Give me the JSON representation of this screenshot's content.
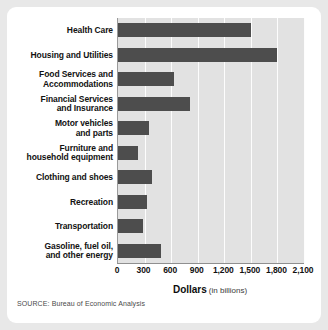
{
  "figure": {
    "source_note": "SOURCE: Bureau of Economic Analysis",
    "axis_title_main": "Dollars",
    "axis_title_sub": "(in billions)",
    "bar_color": "#4d4d4d",
    "plot_background": "#e2e2e2",
    "gridline_color": "#fdfdfd",
    "frame_color": "#ffffff",
    "page_background": "#e8e8e8"
  },
  "chart_data": {
    "type": "bar",
    "orientation": "horizontal",
    "title": "",
    "subtitle": "",
    "xlabel": "Dollars (in billions)",
    "ylabel": "",
    "xlim": [
      0,
      2100
    ],
    "grid": true,
    "legend": null,
    "categories": [
      "Health Care",
      "Housing and Utilities",
      "Food Services and Accommodations",
      "Financial Services and Insurance",
      "Motor vehicles and parts",
      "Furniture and household equipment",
      "Clothing and shoes",
      "Recreation",
      "Transportation",
      "Gasoline, fuel oil, and other energy"
    ],
    "category_label_lines": [
      [
        "Health Care"
      ],
      [
        "Housing and Utilities"
      ],
      [
        "Food Services and",
        "Accommodations"
      ],
      [
        "Financial Services",
        "and Insurance"
      ],
      [
        "Motor vehicles",
        "and parts"
      ],
      [
        "Furniture and",
        "household equipment"
      ],
      [
        "Clothing and shoes"
      ],
      [
        "Recreation"
      ],
      [
        "Transportation"
      ],
      [
        "Gasoline, fuel oil,",
        "and other energy"
      ]
    ],
    "values": [
      1500,
      1790,
      630,
      810,
      355,
      230,
      380,
      330,
      285,
      480
    ],
    "xticks": [
      0,
      300,
      600,
      900,
      1200,
      1500,
      1800,
      2100
    ],
    "xtick_labels": [
      "0",
      "300",
      "600",
      "900",
      "1,200",
      "1,500",
      "1,800",
      "2,100"
    ]
  }
}
